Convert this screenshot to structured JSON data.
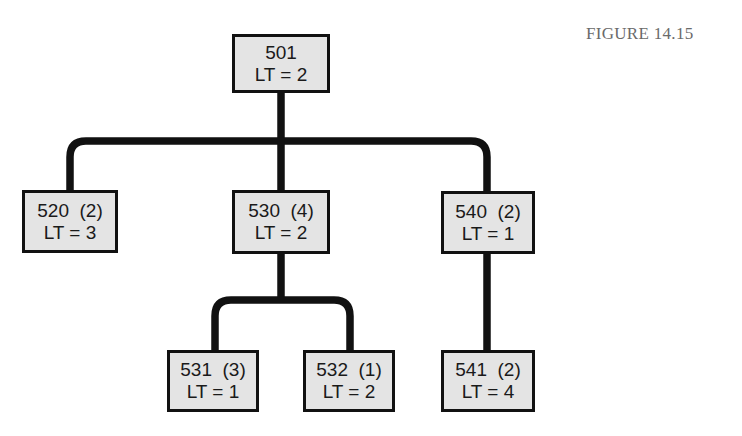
{
  "figure": {
    "caption": "FIGURE 14.15"
  },
  "colors": {
    "box_fill": "#e4e4e4",
    "box_border": "#111111",
    "connector": "#111111",
    "caption_text": "#6a6a6a"
  },
  "tree": {
    "root": {
      "id": "501",
      "id_label": "501",
      "lt_label": "LT = 2",
      "lead_time": 2
    },
    "level1": [
      {
        "id": "520",
        "id_label": "520  (2)",
        "quantity": 2,
        "lt_label": "LT = 3",
        "lead_time": 3,
        "parent": "501"
      },
      {
        "id": "530",
        "id_label": "530  (4)",
        "quantity": 4,
        "lt_label": "LT = 2",
        "lead_time": 2,
        "parent": "501"
      },
      {
        "id": "540",
        "id_label": "540  (2)",
        "quantity": 2,
        "lt_label": "LT = 1",
        "lead_time": 1,
        "parent": "501"
      }
    ],
    "level2": [
      {
        "id": "531",
        "id_label": "531  (3)",
        "quantity": 3,
        "lt_label": "LT = 1",
        "lead_time": 1,
        "parent": "530"
      },
      {
        "id": "532",
        "id_label": "532  (1)",
        "quantity": 1,
        "lt_label": "LT = 2",
        "lead_time": 2,
        "parent": "530"
      },
      {
        "id": "541",
        "id_label": "541  (2)",
        "quantity": 2,
        "lt_label": "LT = 4",
        "lead_time": 4,
        "parent": "540"
      }
    ]
  }
}
